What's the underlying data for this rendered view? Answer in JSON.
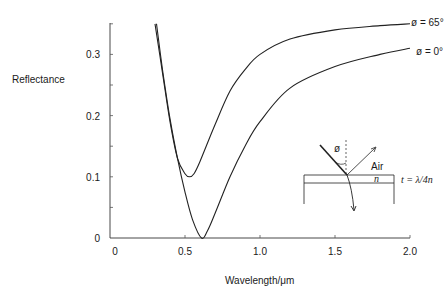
{
  "chart_data": {
    "type": "line",
    "title": "",
    "xlabel": "Wavelength/μm",
    "ylabel": "Reflectance",
    "xlim": [
      0,
      2.0
    ],
    "ylim": [
      0,
      0.35
    ],
    "x_ticks": [
      "0",
      "0.5",
      "1.0",
      "1.5",
      "2.0"
    ],
    "y_ticks": [
      "0",
      "0.1",
      "0.2",
      "0.3"
    ],
    "grid": false,
    "series": [
      {
        "name": "ø = 65°",
        "x": [
          0.3,
          0.35,
          0.4,
          0.45,
          0.5,
          0.53,
          0.56,
          0.6,
          0.7,
          0.8,
          0.9,
          1.0,
          1.2,
          1.5,
          1.8,
          2.0
        ],
        "values": [
          0.35,
          0.27,
          0.19,
          0.13,
          0.105,
          0.1,
          0.105,
          0.125,
          0.185,
          0.24,
          0.275,
          0.3,
          0.325,
          0.34,
          0.347,
          0.35
        ]
      },
      {
        "name": "ø = 0°",
        "x": [
          0.31,
          0.35,
          0.4,
          0.45,
          0.5,
          0.55,
          0.61,
          0.65,
          0.7,
          0.8,
          0.9,
          1.0,
          1.2,
          1.5,
          1.8,
          2.0
        ],
        "values": [
          0.35,
          0.275,
          0.195,
          0.13,
          0.075,
          0.03,
          0.0,
          0.012,
          0.04,
          0.1,
          0.15,
          0.19,
          0.245,
          0.28,
          0.3,
          0.31
        ]
      }
    ],
    "annotations": {
      "inset_diagram": {
        "angle_label": "ø",
        "medium_label": "Air",
        "layer_label": "n",
        "thickness_label": "t = λ/4n"
      }
    }
  },
  "labels": {
    "series_65": "ø = 65°",
    "series_0": "ø = 0°",
    "ylabel": "Reflectance",
    "xlabel": "Wavelength/μm",
    "inset_angle": "ø",
    "inset_air": "Air",
    "inset_n": "n",
    "inset_t": "t = λ/4n"
  }
}
